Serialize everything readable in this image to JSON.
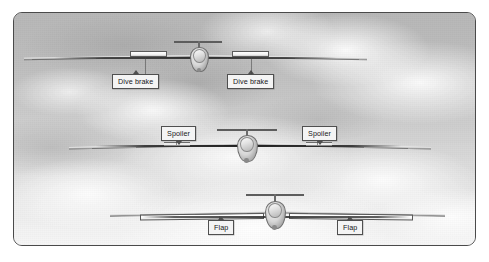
{
  "figure": {
    "border_color": "#4a4a4a",
    "background": "grayscale cloudy sky photograph"
  },
  "aircraft": [
    {
      "id": "glider-dive-brake",
      "row": 1,
      "device": "Dive brake",
      "description": "Sailplane front view with dive brake panels deployed from upper wing surfaces",
      "callouts": [
        {
          "id": "callout-dive-brake-left",
          "label": "Dive brake",
          "pointer": "up"
        },
        {
          "id": "callout-dive-brake-right",
          "label": "Dive brake",
          "pointer": "up"
        }
      ]
    },
    {
      "id": "glider-spoiler",
      "row": 2,
      "device": "Spoiler",
      "description": "Sailplane front view with spoilers raised on the wings",
      "callouts": [
        {
          "id": "callout-spoiler-left",
          "label": "Spoiler",
          "pointer": "down"
        },
        {
          "id": "callout-spoiler-right",
          "label": "Spoiler",
          "pointer": "down"
        }
      ]
    },
    {
      "id": "glider-flap",
      "row": 3,
      "device": "Flap",
      "description": "Sailplane front view with trailing edge flaps lowered",
      "callouts": [
        {
          "id": "callout-flap-left",
          "label": "Flap",
          "pointer": "up"
        },
        {
          "id": "callout-flap-right",
          "label": "Flap",
          "pointer": "up"
        }
      ]
    }
  ],
  "labels": {
    "dive_brake_left": "Dive brake",
    "dive_brake_right": "Dive brake",
    "spoiler_left": "Spoiler",
    "spoiler_right": "Spoiler",
    "flap_left": "Flap",
    "flap_right": "Flap"
  },
  "colors": {
    "border": "#4a4a4a",
    "label_background": "#f4f4f4",
    "label_border": "#4f4f4f",
    "label_text": "#161616",
    "sky_light": "#f6f6f6",
    "sky_dark": "#b7b7b7"
  }
}
